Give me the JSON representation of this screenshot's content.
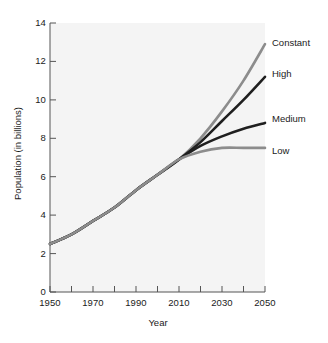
{
  "chart_data": {
    "type": "line",
    "title": "",
    "xlabel": "Year",
    "ylabel": "Population (in billions)",
    "xlim": [
      1950,
      2050
    ],
    "ylim": [
      0,
      14
    ],
    "xticks": [
      1950,
      1970,
      1990,
      2010,
      2030,
      2050
    ],
    "xtick_labels": [
      "1950",
      "1970",
      "1990",
      "2010",
      "2030",
      "2050"
    ],
    "xminor_ticks": [
      1960,
      1980,
      2000,
      2020,
      2040
    ],
    "yticks": [
      0,
      2,
      4,
      6,
      8,
      10,
      12,
      14
    ],
    "ytick_labels": [
      "0",
      "2",
      "4",
      "6",
      "8",
      "10",
      "12",
      "14"
    ],
    "grid": false,
    "legend_position": "right-inline-labels",
    "x": [
      1950,
      1960,
      1970,
      1980,
      1990,
      2000,
      2010,
      2020,
      2030,
      2040,
      2050
    ],
    "series": [
      {
        "name": "Constant",
        "color": "#8c8c8c",
        "values": [
          2.5,
          3.0,
          3.7,
          4.4,
          5.3,
          6.1,
          6.9,
          8.0,
          9.4,
          11.0,
          12.9
        ]
      },
      {
        "name": "High",
        "color": "#1f1f1f",
        "values": [
          2.5,
          3.0,
          3.7,
          4.4,
          5.3,
          6.1,
          6.9,
          7.8,
          8.9,
          10.0,
          11.2
        ]
      },
      {
        "name": "Medium",
        "color": "#1f1f1f",
        "values": [
          2.5,
          3.0,
          3.7,
          4.4,
          5.3,
          6.1,
          6.9,
          7.6,
          8.1,
          8.5,
          8.8
        ]
      },
      {
        "name": "Low",
        "color": "#8c8c8c",
        "values": [
          2.5,
          3.0,
          3.7,
          4.4,
          5.3,
          6.1,
          6.9,
          7.3,
          7.5,
          7.5,
          7.5
        ]
      }
    ],
    "annotations": [
      {
        "text": "Constant",
        "x": 2050,
        "y": 12.9
      },
      {
        "text": "High",
        "x": 2050,
        "y": 11.2
      },
      {
        "text": "Medium",
        "x": 2050,
        "y": 8.8
      },
      {
        "text": "Low",
        "x": 2050,
        "y": 7.5
      }
    ],
    "colors": {
      "plot_background": "#f4f4f4",
      "axis": "#555555",
      "text": "#1a1a1a",
      "gray_series": "#8c8c8c",
      "black_series": "#1f1f1f"
    }
  }
}
